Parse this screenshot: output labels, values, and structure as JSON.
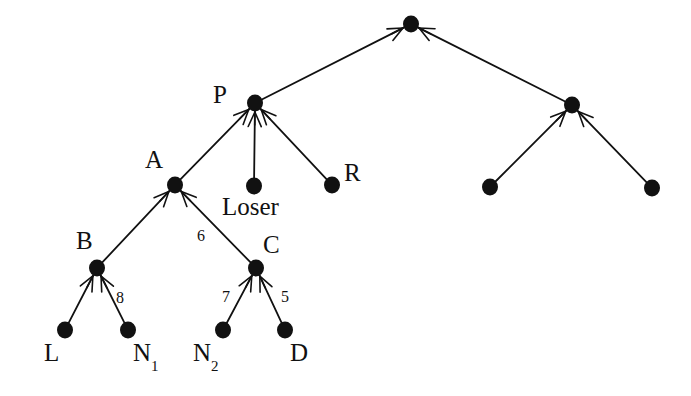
{
  "diagram": {
    "type": "tournament-tree",
    "background_color": "#ffffff",
    "node_color": "#111111",
    "edge_color": "#111111",
    "node_radius": 8,
    "canvas": {
      "width": 691,
      "height": 396
    },
    "nodes": [
      {
        "id": "root",
        "label": "",
        "x": 411,
        "y": 24,
        "label_x": 0,
        "label_y": 0
      },
      {
        "id": "P",
        "label": "P",
        "x": 255,
        "y": 103,
        "label_x": 213,
        "label_y": 82
      },
      {
        "id": "RM",
        "label": "",
        "x": 572,
        "y": 105,
        "label_x": 0,
        "label_y": 0
      },
      {
        "id": "A",
        "label": "A",
        "x": 175,
        "y": 185,
        "label_x": 145,
        "label_y": 147
      },
      {
        "id": "Loser",
        "label": "Loser",
        "x": 254,
        "y": 186,
        "label_x": 222,
        "label_y": 194
      },
      {
        "id": "R",
        "label": "R",
        "x": 332,
        "y": 185,
        "label_x": 344,
        "label_y": 160
      },
      {
        "id": "RL1",
        "label": "",
        "x": 490,
        "y": 187,
        "label_x": 0,
        "label_y": 0
      },
      {
        "id": "RL2",
        "label": "",
        "x": 652,
        "y": 188,
        "label_x": 0,
        "label_y": 0
      },
      {
        "id": "B",
        "label": "B",
        "x": 97,
        "y": 268,
        "label_x": 76,
        "label_y": 228
      },
      {
        "id": "C",
        "label": "C",
        "x": 256,
        "y": 268,
        "label_x": 263,
        "label_y": 232
      },
      {
        "id": "L",
        "label": "L",
        "x": 65,
        "y": 330,
        "label_x": 44,
        "label_y": 340
      },
      {
        "id": "N1",
        "label": "N",
        "sub": "1",
        "x": 128,
        "y": 330,
        "label_x": 133,
        "label_y": 340
      },
      {
        "id": "N2",
        "label": "N",
        "sub": "2",
        "x": 223,
        "y": 330,
        "label_x": 193,
        "label_y": 340
      },
      {
        "id": "D",
        "label": "D",
        "x": 285,
        "y": 330,
        "label_x": 290,
        "label_y": 340
      }
    ],
    "edges": [
      {
        "from": "P",
        "to": "root",
        "arrow": true,
        "weight": ""
      },
      {
        "from": "RM",
        "to": "root",
        "arrow": true,
        "weight": ""
      },
      {
        "from": "A",
        "to": "P",
        "arrow": true,
        "weight": ""
      },
      {
        "from": "Loser",
        "to": "P",
        "arrow": true,
        "weight": ""
      },
      {
        "from": "R",
        "to": "P",
        "arrow": true,
        "weight": ""
      },
      {
        "from": "RL1",
        "to": "RM",
        "arrow": true,
        "weight": ""
      },
      {
        "from": "RL2",
        "to": "RM",
        "arrow": true,
        "weight": ""
      },
      {
        "from": "B",
        "to": "A",
        "arrow": true,
        "weight": ""
      },
      {
        "from": "C",
        "to": "A",
        "arrow": true,
        "weight": "6"
      },
      {
        "from": "L",
        "to": "B",
        "arrow": true,
        "weight": ""
      },
      {
        "from": "N1",
        "to": "B",
        "arrow": true,
        "weight": "8"
      },
      {
        "from": "N2",
        "to": "C",
        "arrow": true,
        "weight": "7"
      },
      {
        "from": "D",
        "to": "C",
        "arrow": true,
        "weight": "5"
      }
    ],
    "edge_weights": [
      {
        "id": "w-6",
        "value": "6",
        "x": 197,
        "y": 228
      },
      {
        "id": "w-8",
        "value": "8",
        "x": 116,
        "y": 290
      },
      {
        "id": "w-7",
        "value": "7",
        "x": 222,
        "y": 289
      },
      {
        "id": "w-5",
        "value": "5",
        "x": 281,
        "y": 289
      }
    ]
  }
}
